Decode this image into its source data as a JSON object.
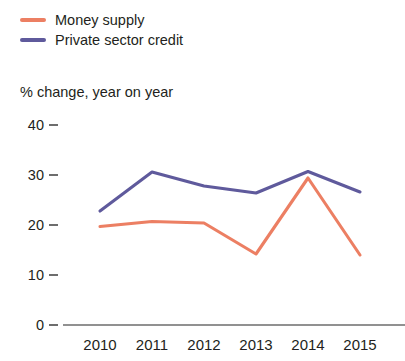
{
  "legend": {
    "items": [
      {
        "label": "Money supply",
        "color": "#ec7f63",
        "name": "money-supply"
      },
      {
        "label": "Private sector credit",
        "color": "#5f5a9c",
        "name": "private-sector-credit"
      }
    ]
  },
  "axis_title": "% change, year on year",
  "axis_line_color": "#6d6d6d",
  "chart_data": {
    "type": "line",
    "title": "",
    "subtitle": "",
    "xlabel": "",
    "ylabel": "% change, year on year",
    "categories": [
      "2010",
      "2011",
      "2012",
      "2013",
      "2014",
      "2015"
    ],
    "x": [
      2010,
      2011,
      2012,
      2013,
      2014,
      2015
    ],
    "series": [
      {
        "name": "Money supply",
        "color": "#ec7f63",
        "values": [
          19.7,
          20.7,
          20.4,
          14.2,
          29.4,
          14.0
        ]
      },
      {
        "name": "Private sector credit",
        "color": "#5f5a9c",
        "values": [
          22.8,
          30.6,
          27.8,
          26.4,
          30.7,
          26.6
        ]
      }
    ],
    "ylim": [
      0,
      40
    ],
    "yticks": [
      0,
      10,
      20,
      30,
      40
    ],
    "ytick_labels": [
      "0",
      "10",
      "20",
      "30",
      "40"
    ],
    "xtick_labels": [
      "2010",
      "2011",
      "2012",
      "2013",
      "2014",
      "2015"
    ],
    "grid": false,
    "legend_position": "top-left"
  }
}
